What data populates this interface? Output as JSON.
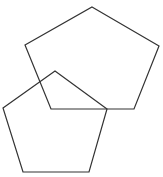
{
  "diagram": {
    "background": "#ffffff",
    "stroke_color": "#333333",
    "stroke_width": 1.2,
    "shapes": [
      {
        "name": "pentagon-upper-right",
        "type": "pentagon",
        "points": "92,7 159,46 134,109 51,109 25,45"
      },
      {
        "name": "pentagon-lower-left",
        "type": "pentagon",
        "points": "55,71 107,109 89,172 23,172 3,108"
      }
    ]
  }
}
